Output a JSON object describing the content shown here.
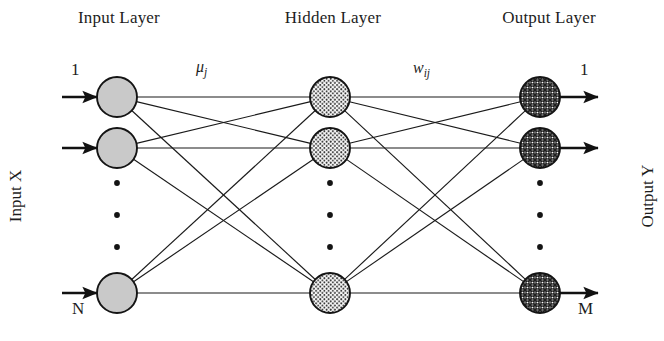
{
  "figure": {
    "width": 664,
    "height": 341,
    "background": "#ffffff",
    "ink_color": "#1a1a1a"
  },
  "layer_titles": {
    "input": "Input Layer",
    "hidden": "Hidden Layer",
    "output": "Output Layer"
  },
  "side_captions": {
    "left": "Input X",
    "right": "Output Y"
  },
  "annotations": {
    "input_first_index": "1",
    "input_last_index": "N",
    "output_first_index": "1",
    "output_last_index": "M",
    "input_to_hidden_weight": "μ",
    "input_to_hidden_weight_sub": "j",
    "hidden_to_output_weight": "w",
    "hidden_to_output_weight_sub": "ij"
  },
  "network": {
    "layers": [
      {
        "id": "input",
        "name": "Input Layer",
        "x": 117,
        "node_radius": 20,
        "fill": "#c9c9c9",
        "texture": "solid-gray",
        "node_rows_y": [
          97,
          148,
          293
        ],
        "visible_node_count": 3,
        "logical_node_count": "N",
        "has_incoming_arrows": true,
        "has_outgoing_arrows": false
      },
      {
        "id": "hidden",
        "name": "Hidden Layer",
        "x": 330,
        "node_radius": 20,
        "fill": "#f2f2f2",
        "texture": "fine-dots",
        "node_rows_y": [
          97,
          148,
          293
        ],
        "visible_node_count": 3,
        "logical_node_count": "J",
        "has_incoming_arrows": false,
        "has_outgoing_arrows": false
      },
      {
        "id": "output",
        "name": "Output Layer",
        "x": 540,
        "node_radius": 20,
        "fill": "#8f8f8f",
        "texture": "cross-hatch",
        "node_rows_y": [
          97,
          148,
          293
        ],
        "visible_node_count": 3,
        "logical_node_count": "M",
        "has_incoming_arrows": false,
        "has_outgoing_arrows": true
      }
    ],
    "connectivity": "fully-connected",
    "edge_groups": [
      {
        "from": "input",
        "to": "hidden",
        "label": "μj",
        "edge_count": 9
      },
      {
        "from": "hidden",
        "to": "output",
        "label": "wij",
        "edge_count": 9
      }
    ],
    "ellipsis": {
      "between_rows": [
        2,
        3
      ],
      "dot_count_per_column": 3,
      "dots_y": [
        183,
        215,
        247
      ],
      "columns_x": [
        117,
        330,
        540
      ]
    },
    "io_arrows": {
      "input_arrow_start_x": 62,
      "input_arrow_end_x": 97,
      "output_arrow_start_x": 560,
      "output_arrow_end_x": 598,
      "rows_y": [
        97,
        148,
        293
      ]
    }
  }
}
